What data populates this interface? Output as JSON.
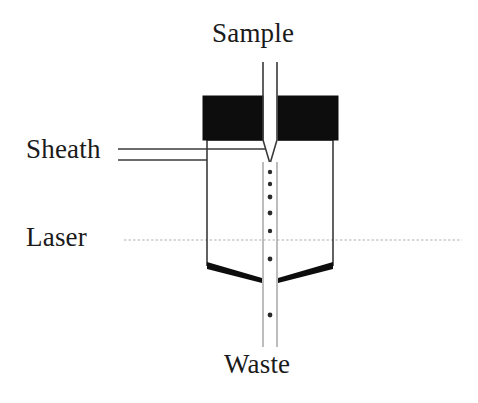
{
  "diagram": {
    "type": "flow-cytometry-flow-cell-schematic",
    "canvas": {
      "width": 478,
      "height": 403,
      "background": "#ffffff"
    },
    "labels": {
      "sample": "Sample",
      "sheath": "Sheath",
      "laser": "Laser",
      "waste": "Waste"
    },
    "colors": {
      "outline": "#3a3a3a",
      "block_fill": "#0d0d0d",
      "wedge_fill": "#0d0d0d",
      "particle_fill": "#2a2a2a",
      "laser_beam": "#d8d8d8",
      "background": "#ffffff"
    },
    "geometry": {
      "sample_tube": {
        "x_left": 263,
        "x_right": 277,
        "y_top": 62,
        "y_taper_start": 140,
        "y_tip": 162
      },
      "block_left": {
        "x": 203,
        "y": 96,
        "width": 60,
        "height": 44
      },
      "block_right": {
        "x": 278,
        "y": 96,
        "width": 60,
        "height": 44
      },
      "chamber": {
        "x_left": 207,
        "x_right": 333,
        "y_top": 140,
        "y_bottom": 272
      },
      "sheath_inlet": {
        "x_start": 118,
        "y_upper": 149,
        "y_lower": 160,
        "x_end": 265
      },
      "wedge_left": {
        "x_outer": 207,
        "x_inner": 262,
        "y_outer": 262,
        "y_inner": 281
      },
      "wedge_right": {
        "x_outer": 333,
        "x_inner": 278,
        "y_outer": 262,
        "y_inner": 281
      },
      "waste_tube": {
        "x_left": 263,
        "x_right": 277,
        "y_top": 281,
        "y_bottom": 347
      },
      "laser_beam": {
        "x_start": 124,
        "x_end": 462,
        "y": 240
      }
    },
    "particles": [
      {
        "x": 270,
        "y": 172,
        "r": 2.2
      },
      {
        "x": 270,
        "y": 184,
        "r": 2.2
      },
      {
        "x": 270,
        "y": 197,
        "r": 2.4
      },
      {
        "x": 270,
        "y": 213,
        "r": 2.4
      },
      {
        "x": 270,
        "y": 231,
        "r": 2.2
      },
      {
        "x": 270,
        "y": 259,
        "r": 2.4
      },
      {
        "x": 270,
        "y": 315,
        "r": 2.4
      }
    ]
  }
}
